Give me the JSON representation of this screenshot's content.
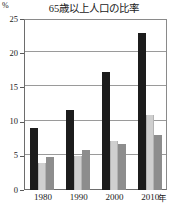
{
  "chart_data": {
    "type": "bar",
    "title": "65歳以上人口の比率",
    "xlabel": "年",
    "ylabel": "%",
    "categories": [
      "1980",
      "1990",
      "2000",
      "2010"
    ],
    "yticks": [
      0,
      5,
      10,
      15,
      20,
      25
    ],
    "ylim": [
      0,
      25
    ],
    "grid": true,
    "legend": "none",
    "series": [
      {
        "name": "series-1-black",
        "color": "#1c1c1c",
        "values": [
          9.1,
          11.7,
          17.2,
          23.0
        ]
      },
      {
        "name": "series-2-light-gray",
        "color": "#cfcfcf",
        "values": [
          3.9,
          4.9,
          7.1,
          11.0
        ]
      },
      {
        "name": "series-3-mid-gray",
        "color": "#8d8d8d",
        "values": [
          4.8,
          5.8,
          6.8,
          8.0
        ]
      }
    ]
  },
  "axis": {
    "y_unit": "%",
    "x_unit": "年",
    "tick_labels_y": [
      "25",
      "20",
      "15",
      "10",
      "5",
      "0"
    ],
    "tick_labels_x": [
      "1980",
      "1990",
      "2000",
      "2010"
    ]
  }
}
